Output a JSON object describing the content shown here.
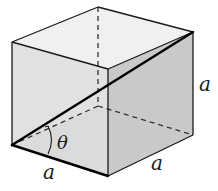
{
  "diagram": {
    "shape": "cube",
    "colors": {
      "background": "#ffffff",
      "top_face": "#f0f0f0",
      "front_face": "#dcdcdc",
      "right_face": "#c9c9c9",
      "bottom_face": "#d6d6d6",
      "edge": "#1a1a1a",
      "hidden_edge": "#333333",
      "diagonal": "#000000"
    },
    "vertices": {
      "top_left": [
        12,
        42
      ],
      "top_back": [
        98,
        7
      ],
      "top_right": [
        193,
        32
      ],
      "top_front": [
        108,
        69
      ],
      "bottom_left": [
        12,
        145
      ],
      "bottom_back": [
        98,
        106
      ],
      "bottom_right": [
        193,
        135
      ],
      "bottom_front": [
        108,
        176
      ]
    },
    "edges_visible": [
      [
        "top_left",
        "top_back"
      ],
      [
        "top_back",
        "top_right"
      ],
      [
        "top_right",
        "top_front"
      ],
      [
        "top_front",
        "top_left"
      ],
      [
        "top_left",
        "bottom_left"
      ],
      [
        "top_front",
        "bottom_front"
      ],
      [
        "top_right",
        "bottom_right"
      ],
      [
        "bottom_front",
        "bottom_right"
      ]
    ],
    "edges_bold": [
      [
        "bottom_left",
        "bottom_front"
      ]
    ],
    "edges_hidden": [
      [
        "top_back",
        "bottom_back"
      ],
      [
        "bottom_back",
        "bottom_left"
      ],
      [
        "bottom_back",
        "bottom_right"
      ]
    ],
    "diagonals": {
      "space_diagonal": [
        "bottom_left",
        "top_right"
      ],
      "face_diagonal_hidden": [
        "bottom_left",
        "bottom_right"
      ]
    },
    "labels": {
      "edge_front_bottom": "a",
      "edge_right_bottom": "a",
      "edge_right_vertical": "a",
      "angle": "θ"
    }
  }
}
